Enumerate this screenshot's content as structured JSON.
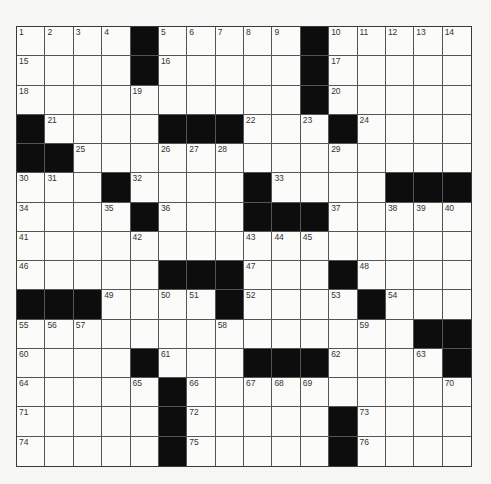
{
  "puzzle": {
    "rows": 15,
    "cols": 16,
    "colors": {
      "background": "#f6f6f4",
      "cell": "#fbfbf9",
      "block": "#0d0d0d",
      "line": "#555555",
      "number": "#333333"
    },
    "grid": [
      [
        1,
        2,
        3,
        4,
        "#",
        5,
        6,
        7,
        8,
        9,
        "#",
        10,
        11,
        12,
        13,
        14
      ],
      [
        15,
        0,
        0,
        0,
        "#",
        16,
        0,
        0,
        0,
        0,
        "#",
        17,
        0,
        0,
        0,
        0
      ],
      [
        18,
        0,
        0,
        0,
        19,
        0,
        0,
        0,
        0,
        0,
        "#",
        20,
        0,
        0,
        0,
        0
      ],
      [
        "#",
        21,
        0,
        0,
        0,
        "#",
        "#",
        "#",
        22,
        0,
        23,
        "#",
        24,
        0,
        0,
        0
      ],
      [
        "#",
        "#",
        25,
        0,
        0,
        26,
        27,
        28,
        0,
        0,
        0,
        29,
        0,
        0,
        0,
        0
      ],
      [
        30,
        31,
        0,
        "#",
        32,
        0,
        0,
        0,
        "#",
        33,
        0,
        0,
        0,
        "#",
        "#",
        "#"
      ],
      [
        34,
        0,
        0,
        35,
        "#",
        36,
        0,
        0,
        "#",
        "#",
        "#",
        37,
        0,
        38,
        39,
        40
      ],
      [
        41,
        0,
        0,
        0,
        42,
        0,
        0,
        0,
        43,
        44,
        45,
        0,
        0,
        0,
        0,
        0
      ],
      [
        46,
        0,
        0,
        0,
        0,
        "#",
        "#",
        "#",
        47,
        0,
        0,
        "#",
        48,
        0,
        0,
        0
      ],
      [
        "#",
        "#",
        "#",
        49,
        0,
        50,
        51,
        "#",
        52,
        0,
        0,
        53,
        "#",
        54,
        0,
        0
      ],
      [
        55,
        56,
        57,
        0,
        0,
        0,
        0,
        58,
        0,
        0,
        0,
        0,
        59,
        0,
        "#",
        "#"
      ],
      [
        60,
        0,
        0,
        0,
        "#",
        61,
        0,
        0,
        "#",
        "#",
        "#",
        62,
        0,
        0,
        63,
        "#"
      ],
      [
        64,
        0,
        0,
        0,
        65,
        "#",
        66,
        0,
        67,
        68,
        69,
        0,
        0,
        0,
        0,
        70
      ],
      [
        71,
        0,
        0,
        0,
        0,
        "#",
        72,
        0,
        0,
        0,
        0,
        "#",
        73,
        0,
        0,
        0
      ],
      [
        74,
        0,
        0,
        0,
        0,
        "#",
        75,
        0,
        0,
        0,
        0,
        "#",
        76,
        0,
        0,
        0
      ]
    ]
  }
}
